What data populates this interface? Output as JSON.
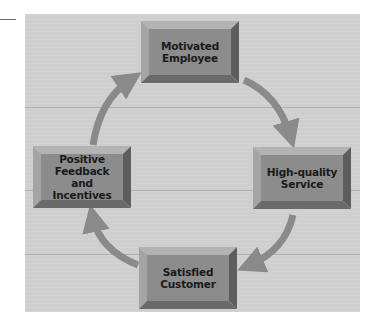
{
  "diagram": {
    "type": "cycle",
    "direction": "clockwise",
    "nodes": [
      {
        "id": "motivated-employee",
        "label": "Motivated\nEmployee",
        "position": "top"
      },
      {
        "id": "high-quality-service",
        "label": "High-quality\nService",
        "position": "right"
      },
      {
        "id": "satisfied-customer",
        "label": "Satisfied\nCustomer",
        "position": "bottom"
      },
      {
        "id": "positive-feedback",
        "label": "Positive\nFeedback\nand Incentives",
        "position": "left"
      }
    ],
    "edges": [
      {
        "from": "motivated-employee",
        "to": "high-quality-service"
      },
      {
        "from": "high-quality-service",
        "to": "satisfied-customer"
      },
      {
        "from": "satisfied-customer",
        "to": "positive-feedback"
      },
      {
        "from": "positive-feedback",
        "to": "motivated-employee"
      }
    ]
  },
  "colors": {
    "panel": "#cfcfcf",
    "box_face": "#8c8c8c",
    "bevel_light": "#b3b3b3",
    "bevel_dark": "#5e5e5e",
    "arrow": "#8a8a8a",
    "text": "#1a1a1a"
  }
}
